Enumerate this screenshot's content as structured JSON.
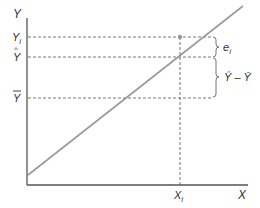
{
  "diagram": {
    "type": "regression-deviation-decomposition",
    "axes": {
      "y_label": "Y",
      "x_label": "X"
    },
    "y_levels": [
      {
        "id": "yi",
        "label": "Y",
        "sub": "i",
        "accent": ""
      },
      {
        "id": "yhat",
        "label": "Y",
        "sub": "",
        "accent": "hat"
      },
      {
        "id": "ybar",
        "label": "Y",
        "sub": "",
        "accent": "bar"
      }
    ],
    "x_marker": {
      "label": "X",
      "sub": "i"
    },
    "braces": [
      {
        "id": "residual",
        "label": "e",
        "sub": "i",
        "from": "yi",
        "to": "yhat"
      },
      {
        "id": "explained",
        "label": "Ŷ – Ȳ",
        "from": "yhat",
        "to": "ybar"
      }
    ],
    "colors": {
      "axis": "#555555",
      "line": "#9a9a9a",
      "dashed": "#777777",
      "point": "#999999",
      "text": "#333333"
    }
  }
}
